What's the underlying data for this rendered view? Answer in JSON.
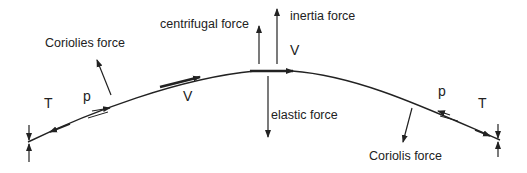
{
  "diagram": {
    "colors": {
      "line": "#222222",
      "background": "#ffffff"
    },
    "labels": {
      "centrifugal": "centrifugal force",
      "inertia": "inertia force",
      "velocity_top": "V",
      "elastic": "elastic force",
      "coriolies_left": "Coriolies force",
      "tension_left": "T",
      "pressure_left": "p",
      "velocity_mid": "V",
      "coriolis_right": "Coriolis force",
      "pressure_right": "p",
      "tension_right": "T"
    }
  }
}
